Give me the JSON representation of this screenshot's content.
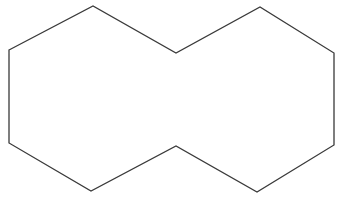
{
  "diagram": {
    "type": "fused-hexagon-outline",
    "stroke_color": "#3a3a3a",
    "background_color": "#ffffff",
    "stroke_width": 1.3,
    "outline_points": [
      [
        9,
        50
      ],
      [
        93,
        6
      ],
      [
        176,
        53
      ],
      [
        260,
        7
      ],
      [
        334,
        53
      ],
      [
        334,
        145
      ],
      [
        257,
        192
      ],
      [
        176,
        146
      ],
      [
        91,
        191
      ],
      [
        9,
        143
      ]
    ]
  }
}
